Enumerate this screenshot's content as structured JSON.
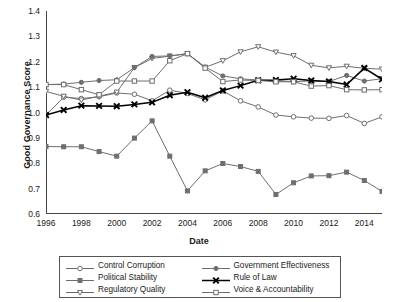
{
  "chart_data": {
    "type": "line",
    "title": "",
    "xlabel": "Date",
    "ylabel": "Good Governance Score",
    "xlim": [
      1996,
      2015
    ],
    "ylim": [
      0.6,
      1.4
    ],
    "yticks": [
      "1.4",
      "1.3",
      "1.2",
      "1.1",
      "1.0",
      "0.9",
      "0.8",
      "0.7",
      "0.6"
    ],
    "xticks": [
      "1996",
      "1998",
      "2000",
      "2002",
      "2004",
      "2006",
      "2008",
      "2010",
      "2012",
      "2014"
    ],
    "grid": false,
    "legend_position": "bottom",
    "x": [
      1996,
      1997,
      1998,
      1999,
      2000,
      2001,
      2002,
      2003,
      2004,
      2005,
      2006,
      2007,
      2008,
      2009,
      2010,
      2011,
      2012,
      2013,
      2014,
      2015
    ],
    "series": [
      {
        "name": "Control Corruption",
        "marker": "open-circle",
        "color": "#6e6e6e",
        "values": [
          0.99,
          1.06,
          1.055,
          1.062,
          1.077,
          1.072,
          1.046,
          1.088,
          1.075,
          1.05,
          1.085,
          1.046,
          1.022,
          0.99,
          0.983,
          0.978,
          0.977,
          0.988,
          0.957,
          0.983
        ]
      },
      {
        "name": "Political Stability",
        "marker": "filled-square",
        "color": "#6e6e6e",
        "values": [
          0.866,
          0.865,
          0.865,
          0.846,
          0.828,
          0.899,
          0.967,
          0.828,
          0.691,
          0.77,
          0.799,
          0.787,
          0.768,
          0.677,
          0.723,
          0.75,
          0.751,
          0.765,
          0.732,
          0.689
        ]
      },
      {
        "name": "Regulatory Quality",
        "marker": "down-triangle",
        "color": "#6e6e6e",
        "values": [
          1.083,
          1.064,
          1.049,
          1.064,
          1.08,
          1.177,
          1.213,
          1.222,
          1.232,
          1.178,
          1.204,
          1.239,
          1.259,
          1.238,
          1.224,
          1.186,
          1.176,
          1.182,
          1.174,
          1.171
        ]
      },
      {
        "name": "Government Effectiveness",
        "marker": "filled-circle",
        "color": "#6e6e6e",
        "values": [
          1.11,
          1.112,
          1.119,
          1.126,
          1.129,
          1.177,
          1.221,
          1.223,
          1.232,
          1.179,
          1.144,
          1.133,
          1.128,
          1.125,
          1.122,
          1.124,
          1.122,
          1.146,
          1.124,
          1.133
        ]
      },
      {
        "name": "Rule of Law",
        "marker": "bold-x",
        "color": "#000000",
        "values": [
          0.99,
          1.01,
          1.027,
          1.026,
          1.025,
          1.032,
          1.04,
          1.068,
          1.08,
          1.058,
          1.087,
          1.106,
          1.127,
          1.128,
          1.133,
          1.126,
          1.122,
          1.11,
          1.175,
          1.131
        ]
      },
      {
        "name": "Voice & Accountability",
        "marker": "open-square",
        "color": "#6e6e6e",
        "values": [
          1.11,
          1.11,
          1.09,
          1.07,
          1.124,
          1.124,
          1.124,
          1.204,
          1.232,
          1.175,
          1.122,
          1.128,
          1.126,
          1.121,
          1.121,
          1.104,
          1.106,
          1.09,
          1.089,
          1.09
        ]
      }
    ]
  },
  "legend": {
    "items": [
      {
        "label": "Control Corruption",
        "marker": "open-circle",
        "color": "#6e6e6e"
      },
      {
        "label": "Government Effectiveness",
        "marker": "filled-circle",
        "color": "#6e6e6e"
      },
      {
        "label": "Political Stability",
        "marker": "filled-square",
        "color": "#6e6e6e"
      },
      {
        "label": "Rule of Law",
        "marker": "bold-x",
        "color": "#000000"
      },
      {
        "label": "Regulatory Quality",
        "marker": "down-triangle",
        "color": "#6e6e6e"
      },
      {
        "label": "Voice & Accountability",
        "marker": "open-square",
        "color": "#6e6e6e"
      }
    ]
  }
}
